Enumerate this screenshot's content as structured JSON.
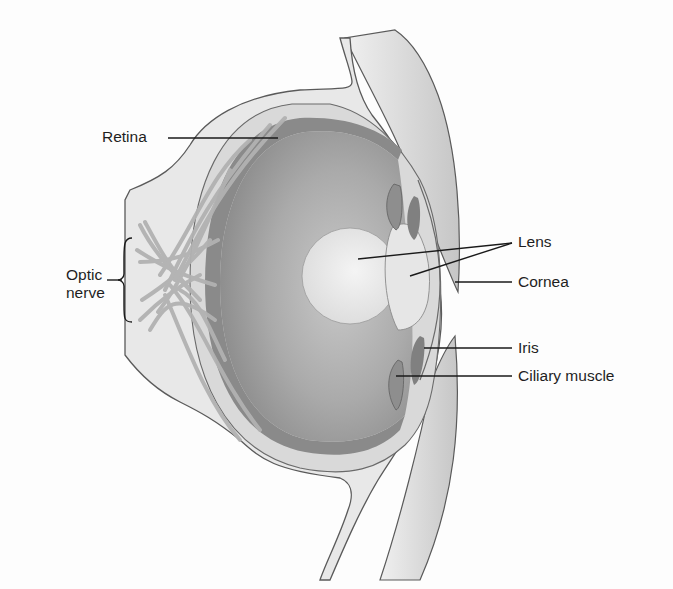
{
  "diagram": {
    "labels": {
      "retina": "Retina",
      "optic_nerve_line1": "Optic",
      "optic_nerve_line2": "nerve",
      "lens": "Lens",
      "cornea": "Cornea",
      "iris": "Iris",
      "ciliary_muscle": "Ciliary muscle"
    },
    "colors": {
      "background": "#fdfdfd",
      "outer_tissue": "#e6e6e6",
      "sclera": "#d4d4d4",
      "retina_band": "#8c8c8c",
      "vitreous_dark": "#9a9a9a",
      "vitreous_light": "#c8c8c8",
      "lens": "#ececec",
      "cornea_fill": "#ebebeb",
      "iris": "#8a8a8a",
      "nerve_fibers": "#b4b4b4",
      "outline": "#5a5a5a",
      "leader_line": "#1a1a1a",
      "text": "#1f1f1f"
    }
  }
}
